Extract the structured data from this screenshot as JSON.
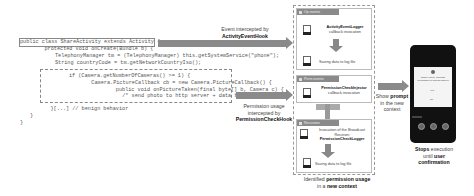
{
  "code": {
    "lines": [
      "public class ShareActivity extends Activity {",
      "    protected void onCreate(Bundle b) {",
      "        TelephonyManager tm = (TelephonyManager) this.getSystemService(\"phone\");",
      "        String countryCode = tm.getNetworkCountryIso();",
      "        if (Camera.getNumberOfCameras() >= 1) {",
      "            Camera.PictureCallback cb = new Camera.PictureCallback() {",
      "                public void onPictureTaken(final byte[] b, Camera c) {",
      "                    /* send photo to http server + data theft*/ }",
      "        }",
      "    }[...] // benign behavior",
      "}",
      "}"
    ]
  },
  "arrows": {
    "top": {
      "line1": "Event intercepted by",
      "line2": "ActivityEventHook"
    },
    "middle": {
      "line1": "Permission usage",
      "line2": "intercepted by",
      "line3": "PermissionCheckHook"
    },
    "right": {
      "line1_pre": "Show ",
      "line1_bold": "prompt",
      "line2": "in the new",
      "line3": "context"
    }
  },
  "panels": {
    "op_events": {
      "header": "Op events",
      "item1_title": "ActivityEventLogger",
      "item1_sub": "callback invocation",
      "item2": "Saving data to log file"
    },
    "perm_events": {
      "header": "Perm events",
      "item1_title": "PermissionCheckInjector",
      "item1_sub": "callback invocation"
    },
    "recursion": {
      "header": "Recursion",
      "item1_line1": "Invocation of the Broadcast",
      "item1_line2": "Receiver",
      "item1_title": "PermissionCheckLogger",
      "item2": "Saving data to log file"
    }
  },
  "bottom_caption": {
    "pre": "Identified ",
    "bold1": "permission usage",
    "line2_pre": "in a ",
    "bold2": "new context"
  },
  "phone_caption": {
    "bold1": "Stops",
    "line1": " execution",
    "line2_pre": "until ",
    "bold2": "user",
    "line3": "confirmation"
  },
  "phone": {
    "dialog_line1": "ShareActivity requests",
    "dialog_line2": "permission to access camera",
    "btn1": "Yes",
    "btn2": "No"
  }
}
